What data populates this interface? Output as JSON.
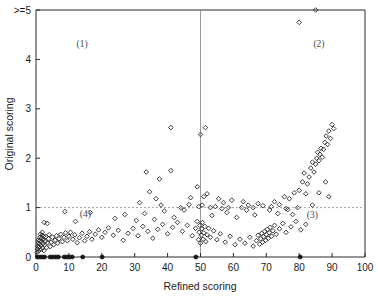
{
  "chart_data": {
    "type": "scatter",
    "title": "",
    "xlabel": "Refined scoring",
    "ylabel": "Original scoring",
    "xlim": [
      0,
      100
    ],
    "ylim": [
      0,
      5
    ],
    "xticks": [
      0,
      10,
      20,
      30,
      40,
      50,
      60,
      70,
      80,
      90,
      100
    ],
    "xtick_labels": [
      "0",
      "10",
      "20",
      "30",
      "40",
      "50",
      "60",
      "70",
      "80",
      "90",
      "100"
    ],
    "yticks": [
      0,
      1,
      2,
      3,
      4,
      5
    ],
    "ytick_labels": [
      "0",
      "1",
      "2",
      "3",
      "4",
      ">=5"
    ],
    "grid": false,
    "legend": "none",
    "reference_lines": [
      {
        "axis": "x",
        "value": 50,
        "style": "solid-thin",
        "color": "#8f8f8f"
      },
      {
        "axis": "y",
        "value": 1,
        "style": "dotted",
        "color": "#9a9a9a"
      }
    ],
    "annotations": [
      {
        "text": "(1)",
        "x": 14,
        "y": 4.25,
        "quadrant": "upper-left"
      },
      {
        "text": "(2)",
        "x": 86,
        "y": 4.25,
        "quadrant": "upper-right"
      },
      {
        "text": "(3)",
        "x": 84,
        "y": 0.78,
        "quadrant": "lower-right"
      },
      {
        "text": "(4)",
        "x": 15,
        "y": 0.8,
        "quadrant": "lower-left"
      }
    ],
    "series": [
      {
        "name": "solid-baseline-points",
        "marker": "filled-circle",
        "points": [
          [
            0.4,
            0
          ],
          [
            1.2,
            0
          ],
          [
            1.9,
            0
          ],
          [
            2.6,
            0
          ],
          [
            4.3,
            0
          ],
          [
            5.1,
            0
          ],
          [
            6.0,
            0
          ],
          [
            6.8,
            0
          ],
          [
            8.6,
            0
          ],
          [
            9.4,
            0
          ],
          [
            10.2,
            0
          ],
          [
            11.0,
            0
          ],
          [
            14.2,
            0
          ],
          [
            20.1,
            0
          ],
          [
            48.6,
            0
          ],
          [
            80.3,
            0
          ]
        ]
      },
      {
        "name": "open-diamond-points",
        "marker": "open-diamond",
        "points": [
          [
            0.3,
            0.1
          ],
          [
            0.4,
            0.16
          ],
          [
            0.5,
            0.22
          ],
          [
            0.6,
            0.28
          ],
          [
            0.7,
            0.34
          ],
          [
            0.8,
            0.12
          ],
          [
            0.9,
            0.2
          ],
          [
            1.0,
            0.26
          ],
          [
            1.1,
            0.33
          ],
          [
            1.2,
            0.4
          ],
          [
            1.3,
            0.46
          ],
          [
            1.4,
            0.15
          ],
          [
            1.5,
            0.23
          ],
          [
            1.6,
            0.31
          ],
          [
            1.7,
            0.38
          ],
          [
            1.8,
            0.44
          ],
          [
            1.9,
            0.5
          ],
          [
            2.0,
            0.18
          ],
          [
            2.1,
            0.27
          ],
          [
            2.2,
            0.35
          ],
          [
            2.3,
            0.42
          ],
          [
            2.4,
            0.13
          ],
          [
            2.6,
            0.24
          ],
          [
            2.8,
            0.32
          ],
          [
            3.0,
            0.41
          ],
          [
            3.2,
            0.19
          ],
          [
            3.5,
            0.29
          ],
          [
            3.8,
            0.37
          ],
          [
            4.0,
            0.45
          ],
          [
            4.3,
            0.21
          ],
          [
            4.6,
            0.3
          ],
          [
            5.0,
            0.4
          ],
          [
            5.4,
            0.25
          ],
          [
            5.8,
            0.34
          ],
          [
            6.2,
            0.43
          ],
          [
            6.6,
            0.28
          ],
          [
            7.0,
            0.37
          ],
          [
            7.5,
            0.46
          ],
          [
            8.0,
            0.31
          ],
          [
            8.5,
            0.4
          ],
          [
            9.0,
            0.49
          ],
          [
            9.5,
            0.33
          ],
          [
            10.0,
            0.42
          ],
          [
            10.5,
            0.5
          ],
          [
            11.2,
            0.36
          ],
          [
            11.8,
            0.45
          ],
          [
            12.5,
            0.29
          ],
          [
            13.2,
            0.39
          ],
          [
            14.0,
            0.48
          ],
          [
            14.8,
            0.33
          ],
          [
            15.5,
            0.42
          ],
          [
            16.3,
            0.51
          ],
          [
            17.0,
            0.36
          ],
          [
            18.0,
            0.46
          ],
          [
            19.0,
            0.55
          ],
          [
            20.0,
            0.4
          ],
          [
            21.0,
            0.5
          ],
          [
            22.0,
            0.59
          ],
          [
            23.5,
            0.44
          ],
          [
            25.0,
            0.54
          ],
          [
            26.5,
            0.34
          ],
          [
            28.0,
            0.48
          ],
          [
            29.5,
            0.58
          ],
          [
            31.0,
            0.43
          ],
          [
            32.5,
            0.62
          ],
          [
            34.0,
            0.52
          ],
          [
            35.5,
            0.38
          ],
          [
            37.0,
            0.56
          ],
          [
            38.5,
            0.66
          ],
          [
            40.0,
            0.47
          ],
          [
            41.5,
            0.6
          ],
          [
            43.0,
            0.7
          ],
          [
            44.5,
            0.52
          ],
          [
            46.0,
            0.64
          ],
          [
            47.5,
            0.43
          ],
          [
            48.5,
            0.58
          ],
          [
            49.0,
            0.72
          ],
          [
            49.4,
            0.35
          ],
          [
            49.6,
            0.5
          ],
          [
            49.8,
            0.64
          ],
          [
            50.0,
            0.28
          ],
          [
            50.2,
            0.44
          ],
          [
            50.4,
            0.57
          ],
          [
            50.6,
            0.7
          ],
          [
            50.8,
            0.36
          ],
          [
            51.0,
            0.49
          ],
          [
            51.3,
            0.62
          ],
          [
            51.6,
            0.31
          ],
          [
            52.0,
            0.45
          ],
          [
            52.5,
            0.58
          ],
          [
            53.0,
            0.4
          ],
          [
            54.0,
            0.53
          ],
          [
            55.0,
            0.35
          ],
          [
            56.0,
            0.47
          ],
          [
            57.5,
            0.3
          ],
          [
            59.0,
            0.42
          ],
          [
            60.5,
            0.25
          ],
          [
            62.0,
            0.36
          ],
          [
            63.5,
            0.28
          ],
          [
            65.0,
            0.4
          ],
          [
            66.0,
            0.22
          ],
          [
            67.0,
            0.33
          ],
          [
            67.5,
            0.44
          ],
          [
            68.0,
            0.26
          ],
          [
            68.3,
            0.37
          ],
          [
            68.6,
            0.48
          ],
          [
            68.9,
            0.3
          ],
          [
            69.2,
            0.41
          ],
          [
            69.5,
            0.52
          ],
          [
            69.8,
            0.34
          ],
          [
            70.0,
            0.45
          ],
          [
            70.3,
            0.56
          ],
          [
            70.6,
            0.38
          ],
          [
            70.9,
            0.49
          ],
          [
            71.2,
            0.6
          ],
          [
            71.6,
            0.42
          ],
          [
            72.0,
            0.53
          ],
          [
            72.5,
            0.64
          ],
          [
            73.0,
            0.46
          ],
          [
            74.0,
            0.57
          ],
          [
            75.0,
            0.68
          ],
          [
            76.0,
            0.5
          ],
          [
            77.5,
            0.61
          ],
          [
            79.0,
            0.72
          ],
          [
            80.5,
            0.55
          ],
          [
            82.0,
            0.66
          ],
          [
            2.5,
            0.7
          ],
          [
            3.4,
            0.68
          ],
          [
            8.8,
            0.92
          ],
          [
            16.5,
            0.9
          ],
          [
            12.0,
            0.72
          ],
          [
            24.0,
            0.78
          ],
          [
            27.0,
            0.86
          ],
          [
            30.5,
            0.74
          ],
          [
            33.0,
            0.88
          ],
          [
            36.0,
            0.76
          ],
          [
            39.0,
            0.93
          ],
          [
            42.0,
            0.8
          ],
          [
            45.0,
            0.95
          ],
          [
            53.5,
            0.84
          ],
          [
            58.0,
            0.9
          ],
          [
            61.0,
            0.8
          ],
          [
            64.0,
            0.95
          ],
          [
            66.5,
            0.85
          ],
          [
            71.0,
            0.95
          ],
          [
            73.5,
            0.88
          ],
          [
            76.5,
            0.96
          ],
          [
            78.0,
            0.86
          ],
          [
            41.0,
            1.75
          ],
          [
            49.0,
            1.42
          ],
          [
            51.0,
            1.22
          ],
          [
            52.0,
            1.28
          ],
          [
            49.5,
            1.02
          ],
          [
            50.5,
            1.05
          ],
          [
            53.0,
            1.0
          ],
          [
            54.5,
            1.02
          ],
          [
            56.5,
            0.98
          ],
          [
            58.5,
            1.0
          ],
          [
            62.5,
            1.0
          ],
          [
            64.5,
            1.05
          ],
          [
            66.0,
            1.0
          ],
          [
            69.0,
            1.04
          ],
          [
            71.5,
            1.02
          ],
          [
            38.0,
            1.05
          ],
          [
            36.5,
            1.18
          ],
          [
            34.5,
            1.32
          ],
          [
            31.5,
            1.1
          ],
          [
            44.0,
            1.0
          ],
          [
            46.5,
            1.06
          ],
          [
            47.0,
            1.2
          ],
          [
            55.5,
            1.18
          ],
          [
            57.0,
            1.1
          ],
          [
            59.5,
            1.15
          ],
          [
            63.0,
            1.12
          ],
          [
            67.5,
            1.08
          ],
          [
            72.5,
            1.12
          ],
          [
            75.5,
            1.22
          ],
          [
            74.0,
            1.06
          ],
          [
            77.0,
            1.18
          ],
          [
            78.5,
            1.3
          ],
          [
            80.0,
            1.35
          ],
          [
            81.0,
            1.52
          ],
          [
            81.5,
            1.7
          ],
          [
            82.0,
            1.28
          ],
          [
            82.5,
            1.48
          ],
          [
            83.0,
            1.62
          ],
          [
            83.5,
            1.8
          ],
          [
            84.0,
            1.92
          ],
          [
            84.5,
            1.72
          ],
          [
            85.0,
            1.88
          ],
          [
            85.3,
            2.0
          ],
          [
            85.6,
            2.12
          ],
          [
            86.0,
            1.95
          ],
          [
            86.3,
            2.08
          ],
          [
            86.6,
            2.2
          ],
          [
            87.0,
            2.02
          ],
          [
            87.4,
            2.18
          ],
          [
            87.8,
            2.32
          ],
          [
            88.2,
            2.45
          ],
          [
            88.6,
            2.28
          ],
          [
            89.0,
            2.55
          ],
          [
            89.5,
            2.4
          ],
          [
            90.0,
            2.68
          ],
          [
            90.5,
            2.6
          ],
          [
            79.5,
            1.0
          ],
          [
            76.0,
            0.98
          ],
          [
            84.0,
            1.05
          ],
          [
            86.0,
            1.3
          ],
          [
            88.0,
            1.52
          ],
          [
            89.0,
            1.22
          ],
          [
            80.0,
            4.75
          ],
          [
            85.0,
            5.0
          ],
          [
            51.5,
            2.62
          ],
          [
            50.0,
            2.48
          ],
          [
            41.0,
            2.62
          ],
          [
            37.5,
            1.58
          ],
          [
            33.5,
            1.72
          ]
        ]
      }
    ]
  },
  "axis": {
    "x_label": "Refined scoring",
    "y_label": "Original scoring",
    "x_ticks": [
      "0",
      "10",
      "20",
      "30",
      "40",
      "50",
      "60",
      "70",
      "80",
      "90",
      "100"
    ],
    "y_ticks": [
      "0",
      "1",
      "2",
      "3",
      "4",
      ">=5"
    ]
  },
  "quadrants": {
    "one": "(1)",
    "two": "(2)",
    "three": "(3)",
    "four": "(4)"
  },
  "colors": {
    "background": "#ffffff",
    "axis": "#2b2b2b",
    "marker": "#262626",
    "marker_solid": "#141414",
    "reference": "#9a9a9a",
    "text": "#1a1a1a"
  }
}
